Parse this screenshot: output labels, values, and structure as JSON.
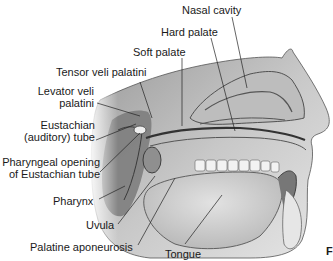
{
  "figure": {
    "corner_mark": "F"
  },
  "labels": {
    "nasal_cavity": "Nasal cavity",
    "hard_palate": "Hard palate",
    "soft_palate": "Soft palate",
    "tensor_veli_palatini": "Tensor veli palatini",
    "levator_line1": "Levator veli",
    "levator_line2": "palatini",
    "eustachian_line1": "Eustachian",
    "eustachian_line2": "(auditory) tube",
    "pharyngeal_line1": "Pharyngeal opening",
    "pharyngeal_line2": "of Eustachian tube",
    "pharynx": "Pharynx",
    "uvula": "Uvula",
    "palatine_aponeurosis": "Palatine aponeurosis",
    "tongue": "Tongue"
  }
}
